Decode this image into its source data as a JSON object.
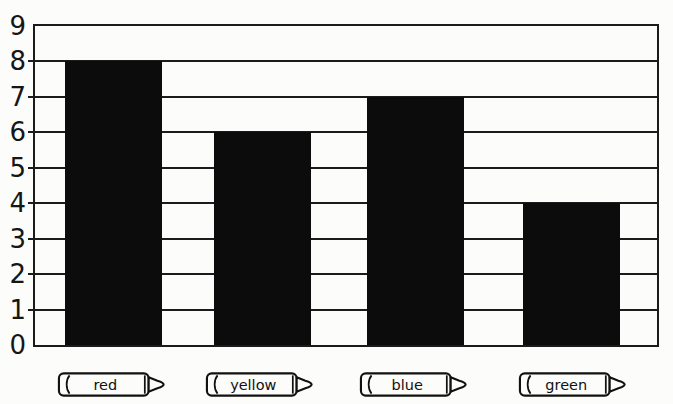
{
  "page": {
    "background": "#fcfcfa",
    "ink": "#1b1b1b"
  },
  "chart_data": {
    "type": "bar",
    "title": "",
    "subtitle": "",
    "categories": [
      "red",
      "yellow",
      "blue",
      "green"
    ],
    "values": [
      8,
      6,
      7,
      4
    ],
    "xlabel": "",
    "ylabel": "",
    "ylim": [
      0,
      9
    ],
    "yticks": [
      0,
      1,
      2,
      3,
      4,
      5,
      6,
      7,
      8,
      9
    ],
    "grid": true,
    "legend_position": "none",
    "bar_color": "#0c0c0c",
    "axis_color": "#1b1b1b",
    "category_icon": "crayon-icon"
  }
}
